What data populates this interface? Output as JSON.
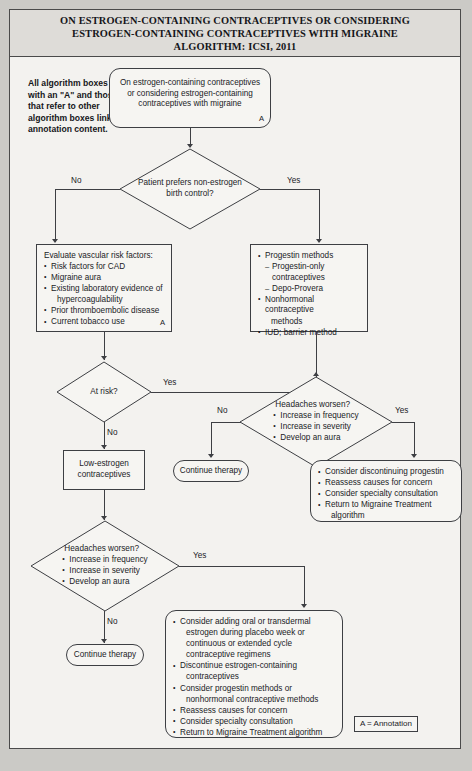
{
  "title": {
    "line1": "ON ESTROGEN-CONTAINING CONTRACEPTIVES OR CONSIDERING",
    "line2": "ESTROGEN-CONTAINING CONTRACEPTIVES WITH MIGRAINE",
    "line3": "ALGORITHM: ICSI, 2011"
  },
  "note": "All algorithm boxes with an \"A\" and those that refer to other algorithm boxes link to annotation content.",
  "legend": "A = Annotation",
  "annotation_marker": "A",
  "edges": {
    "no_1": "No",
    "yes_1": "Yes",
    "yes_2": "Yes",
    "no_2": "No",
    "no_3": "No",
    "yes_3": "Yes",
    "yes_4": "Yes",
    "no_4": "No"
  },
  "nodes": {
    "start": {
      "name": "start-node",
      "line1": "On estrogen-containing contraceptives",
      "line2": "or considering estrogen-containing",
      "line3": "contraceptives with migraine"
    },
    "decision_pref": {
      "name": "decision-patient-prefers",
      "line1": "Patient prefers non-estrogen",
      "line2": "birth control?"
    },
    "vascular": {
      "name": "evaluate-vascular-risk",
      "heading": "Evaluate vascular risk factors:",
      "items": [
        "Risk factors for CAD",
        "Migraine aura",
        "Existing laboratory evidence of",
        "hypercoagulability",
        "Prior thromboembolic disease",
        "Current tobacco use"
      ]
    },
    "progestin": {
      "name": "progestin-methods",
      "items": [
        "Progestin methods",
        "Progestin-only contraceptives",
        "Depo-Provera",
        "Nonhormonal contraceptive",
        "methods",
        "IUD; barrier method"
      ]
    },
    "decision_atrisk": {
      "name": "decision-at-risk",
      "label": "At risk?"
    },
    "low_estrogen": {
      "name": "low-estrogen-contraceptives",
      "line1": "Low-estrogen",
      "line2": "contraceptives"
    },
    "decision_headaches_right": {
      "name": "decision-headaches-worsen-right",
      "heading": "Headaches worsen?",
      "items": [
        "Increase in frequency",
        "Increase in severity",
        "Develop an aura"
      ]
    },
    "decision_headaches_left": {
      "name": "decision-headaches-worsen-left",
      "heading": "Headaches worsen?",
      "items": [
        "Increase in frequency",
        "Increase in severity",
        "Develop an aura"
      ]
    },
    "continue_left": {
      "name": "continue-therapy-upper",
      "label": "Continue therapy"
    },
    "continue_bottom": {
      "name": "continue-therapy-lower",
      "label": "Continue therapy"
    },
    "discontinue_progestin": {
      "name": "consider-discontinuing-progestin",
      "items": [
        "Consider discontinuing progestin",
        "Reassess causes for concern",
        "Consider specialty consultation",
        "Return to Migraine Treatment",
        "algorithm"
      ]
    },
    "final_actions": {
      "name": "final-recommendations",
      "items": [
        "Consider adding oral or transdermal",
        "estrogen during placebo week or",
        "continuous or extended cycle",
        "contraceptive regimens",
        "Discontinue estrogen-containing",
        "contraceptives",
        "Consider progestin methods or",
        "nonhormonal contraceptive methods",
        "Reassess causes for concern",
        "Consider specialty consultation",
        "Return to Migraine Treatment algorithm"
      ]
    }
  }
}
